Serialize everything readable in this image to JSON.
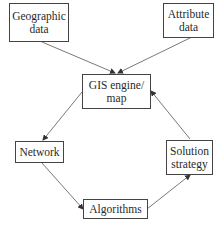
{
  "diagram": {
    "nodes": [
      {
        "id": "geographic",
        "lines": [
          "Geographic",
          "data"
        ]
      },
      {
        "id": "attribute",
        "lines": [
          "Attribute",
          "data"
        ]
      },
      {
        "id": "gis",
        "lines": [
          "GIS engine/",
          "map"
        ]
      },
      {
        "id": "network",
        "lines": [
          "Network"
        ]
      },
      {
        "id": "solution",
        "lines": [
          "Solution",
          "strategy"
        ]
      },
      {
        "id": "algorithms",
        "lines": [
          "Algorithms"
        ]
      }
    ],
    "edges": [
      {
        "from": "geographic",
        "to": "gis"
      },
      {
        "from": "attribute",
        "to": "gis"
      },
      {
        "from": "gis",
        "to": "network"
      },
      {
        "from": "network",
        "to": "algorithms"
      },
      {
        "from": "algorithms",
        "to": "solution"
      },
      {
        "from": "solution",
        "to": "gis"
      }
    ],
    "colors": {
      "line": "#444444",
      "text": "#2a2a2a",
      "background": "#ffffff"
    }
  }
}
